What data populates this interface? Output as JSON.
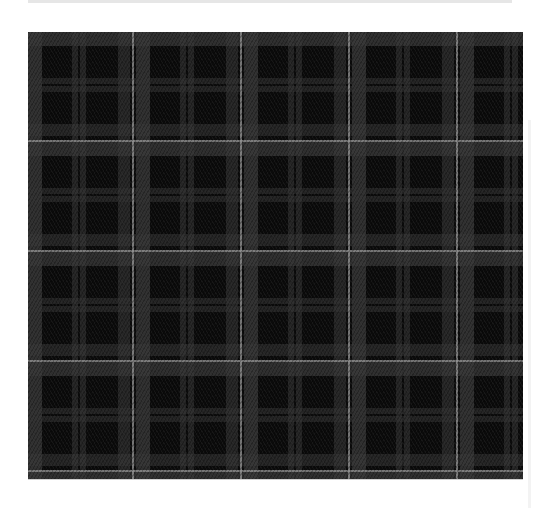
{
  "image": {
    "subject": "Dark gray and black tartan plaid fabric swatch",
    "pattern": "tartan-plaid",
    "colors": {
      "background": "#ffffff",
      "top_bar": "#e6e6e6",
      "base_black": "#0b0b0b",
      "charcoal_band": "#3a3a3a",
      "pin_stripe": "#969696"
    },
    "sett_repeat_px": {
      "horizontal": 108,
      "vertical": 110
    }
  }
}
